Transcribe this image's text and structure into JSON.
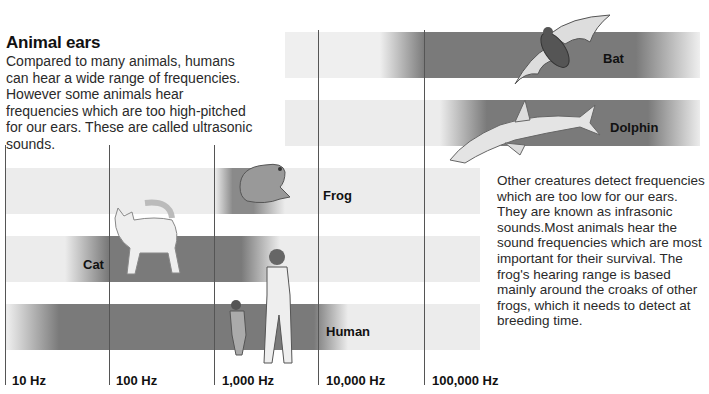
{
  "title": "Animal ears",
  "intro_text": "Compared to many animals, humans can hear a wide range of frequencies. However some animals hear frequencies which are too high-pitched for our ears. These are called ultrasonic sounds.",
  "side_text": "Other creatures detect frequencies which are too low for our ears. They are known as infrasonic sounds.Most animals hear the sound frequencies which are most important for their survival. The frog's hearing range is based mainly around the croaks of other frogs, which it needs to detect at breeding time.",
  "axis": {
    "ticks": [
      "10 Hz",
      "100 Hz",
      "1,000 Hz",
      "10,000 Hz",
      "100,000 Hz"
    ],
    "scale": "log10"
  },
  "animals": [
    {
      "name": "Bat",
      "label": "Bat",
      "icon": "bat-illustration"
    },
    {
      "name": "Dolphin",
      "label": "Dolphin",
      "icon": "dolphin-illustration"
    },
    {
      "name": "Frog",
      "label": "Frog",
      "icon": "frog-illustration"
    },
    {
      "name": "Cat",
      "label": "Cat",
      "icon": "cat-illustration"
    },
    {
      "name": "Human",
      "label": "Human",
      "icon": "human-illustration"
    }
  ],
  "colors": {
    "band_dark": "#7a7a7a",
    "row_light": "#ececec",
    "gridline": "#555555",
    "text": "#222222"
  }
}
